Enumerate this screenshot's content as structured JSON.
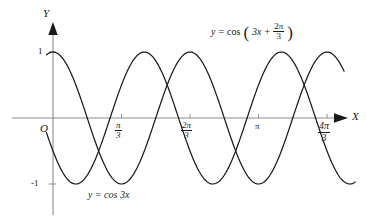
{
  "chart_data": {
    "type": "line",
    "title": "",
    "xlabel": "X",
    "ylabel": "Y",
    "xlim": [
      -0.6,
      4.8
    ],
    "ylim": [
      -1.45,
      1.45
    ],
    "grid": false,
    "legend": "inline-annotations",
    "x_unit": "pi/3",
    "x_tick_labels": [
      "π/3",
      "2π/3",
      "π",
      "4π/3"
    ],
    "x_tick_values": [
      1.0472,
      2.0944,
      3.1416,
      4.1888
    ],
    "y_tick_labels": [
      "1",
      "-1"
    ],
    "y_tick_values": [
      1,
      -1
    ],
    "origin_label": "O",
    "series": [
      {
        "name": "y = cos 3x",
        "formula": "cos(3x)",
        "amplitude": 1,
        "period": 2.0944,
        "phase": 0,
        "color": "#1a1a1a"
      },
      {
        "name": "y = cos(3x + 2π/3)",
        "formula": "cos(3x + 2π/3)",
        "amplitude": 1,
        "period": 2.0944,
        "phase": 2.0944,
        "color": "#1a1a1a"
      }
    ],
    "annotations": [
      {
        "text": "y = cos(3x + 2π/3)",
        "x": 2.6,
        "y": 1.28
      },
      {
        "text": "y = cos 3x",
        "x": 1.3,
        "y": -1.18
      }
    ]
  },
  "axes": {
    "y_axis_letter": "Y",
    "x_axis_letter": "X",
    "origin": "O",
    "y_top_tick_label": "1",
    "y_bottom_tick_label": "-1"
  },
  "ticks": {
    "t1": {
      "num": "π",
      "den": "3"
    },
    "t2": {
      "num": "2π",
      "den": "3"
    },
    "t3": {
      "whole": "π"
    },
    "t4": {
      "num": "4π",
      "den": "3"
    }
  },
  "equations": {
    "shifted": {
      "lhs": "y",
      "eq": "=",
      "fn": "cos",
      "open": "(",
      "arg_first": "3x",
      "plus": "+",
      "frac_num": "2π",
      "frac_den": "3",
      "close": ")"
    },
    "base": {
      "lhs": "y",
      "eq": "=",
      "fn": "cos 3x"
    }
  },
  "colors": {
    "curve": "#1a1a1a",
    "axis": "#8a8a93",
    "text": "#1a1a1a",
    "background": "#ffffff"
  }
}
